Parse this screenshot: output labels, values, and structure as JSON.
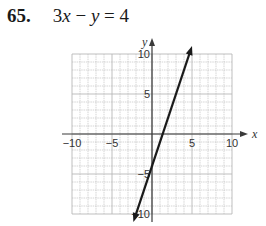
{
  "problem": {
    "number": "65.",
    "equation_parts": [
      "3",
      "x",
      " − ",
      "y",
      " = 4"
    ]
  },
  "chart_data": {
    "type": "line",
    "title": "3x − y = 4",
    "xlabel": "x",
    "ylabel": "y",
    "xlim": [
      -10,
      10
    ],
    "ylim": [
      -10,
      10
    ],
    "grid": true,
    "x_ticks": [
      "-10",
      "-5",
      "5",
      "10"
    ],
    "y_ticks": [
      "10",
      "5",
      "-5",
      "-10"
    ],
    "series": [
      {
        "name": "y = 3x - 4",
        "slope": 3,
        "intercept": -4,
        "x": [
          -2.33,
          0,
          1.33,
          5
        ],
        "y": [
          -11,
          -4,
          0,
          11
        ],
        "arrows": "both"
      }
    ]
  },
  "colors": {
    "grid": "#b8b8b8",
    "axis": "#3a3a3a",
    "line": "#1a1a1a"
  }
}
